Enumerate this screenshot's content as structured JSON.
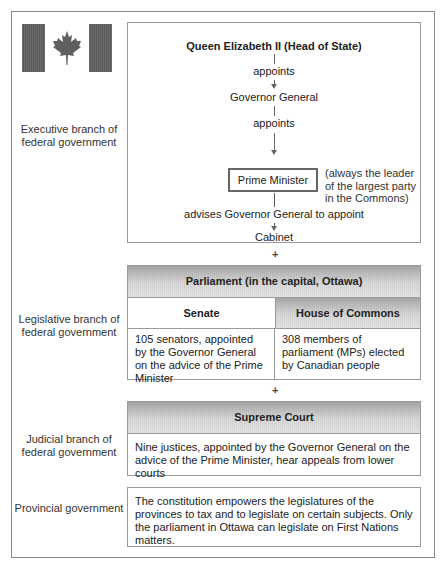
{
  "flag": {
    "icon": "canada-flag-icon",
    "colors": {
      "bars": "#5f5f5f",
      "leaf": "#5f5f5f"
    }
  },
  "executive": {
    "label": "Executive branch of federal government",
    "head": "Queen Elizabeth II (Head of State)",
    "appoints1": "appoints",
    "governor": "Governor General",
    "appoints2": "appoints",
    "pm": "Prime Minister",
    "pm_note": [
      "(always the leader",
      "of the largest party",
      "in the Commons)"
    ],
    "advises": "advises Governor General to appoint",
    "cabinet": "Cabinet"
  },
  "plus": "+",
  "legislative": {
    "label": "Legislative branch of federal government",
    "header": "Parliament (in the capital, Ottawa)",
    "senate": {
      "title": "Senate",
      "text": "105 senators, appointed by the Governor General on the advice of the Prime Minister"
    },
    "commons": {
      "title": "House of Commons",
      "text": "308 members of parliament (MPs) elected by Canadian people"
    }
  },
  "judicial": {
    "label": "Judicial branch of federal government",
    "header": "Supreme Court",
    "text": "Nine justices, appointed by the Governor General on the advice of the Prime Minister, hear appeals from lower courts"
  },
  "provincial": {
    "label": "Provincial government",
    "text": "The constitution empowers the legislatures of the provinces to tax and to legislate on certain subjects. Only the parliament in Ottawa can legislate on First Nations matters."
  }
}
